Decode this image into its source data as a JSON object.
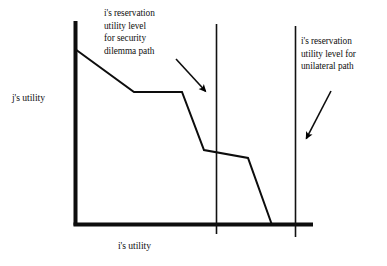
{
  "figure": {
    "background_color": "#ffffff",
    "ink_color": "#000000",
    "axis_labels": {
      "y": "j's utility",
      "x": "i's utility"
    },
    "annotations": [
      {
        "name": "security-dilemma-annotation",
        "text": "i's reservation\nutility level\nfor security\ndilemma path"
      },
      {
        "name": "unilateral-path-annotation",
        "text": "i's reservation\nutility level for\nunilateral path"
      }
    ]
  },
  "chart_data": {
    "type": "line",
    "title": "",
    "xlabel": "i's utility",
    "ylabel": "j's utility",
    "grid": false,
    "legend": "none",
    "axes": {
      "origin": [
        74,
        225
      ],
      "y_axis_top": [
        74,
        21
      ],
      "x_axis_right": [
        313,
        225
      ],
      "axis_stroke_width": 4
    },
    "series": [
      {
        "name": "bargaining frontier",
        "stroke_width": 2,
        "points": [
          [
            75,
            49
          ],
          [
            134,
            92
          ],
          [
            182,
            92
          ],
          [
            204,
            150
          ],
          [
            248,
            158
          ],
          [
            272,
            225
          ]
        ]
      }
    ],
    "reference_lines": [
      {
        "name": "security-dilemma-reservation-line",
        "orientation": "vertical",
        "x": 216,
        "y_top": 24,
        "y_bottom": 234,
        "stroke_width": 1.6
      },
      {
        "name": "unilateral-reservation-line",
        "orientation": "vertical",
        "x": 295,
        "y_top": 26,
        "y_bottom": 237,
        "stroke_width": 1.6
      }
    ],
    "arrows": [
      {
        "name": "security-dilemma-arrow",
        "from": [
          176,
          59
        ],
        "to": [
          209,
          95
        ]
      },
      {
        "name": "unilateral-path-arrow",
        "from": [
          331,
          91
        ],
        "to": [
          304,
          143
        ]
      }
    ]
  }
}
